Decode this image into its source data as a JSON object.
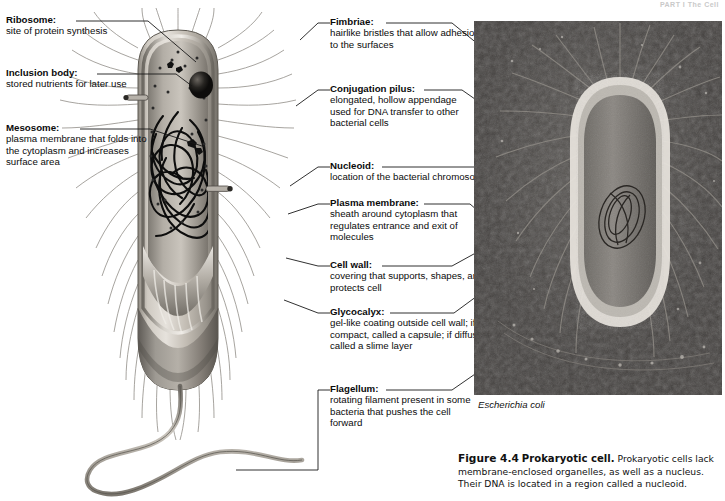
{
  "header": {
    "running_head": "PART I  The Cell"
  },
  "labels_left": [
    {
      "id": "ribosome",
      "term": "Ribosome:",
      "desc": "site of protein synthesis"
    },
    {
      "id": "inclusion-body",
      "term": "Inclusion body:",
      "desc": "stored nutrients for later use"
    },
    {
      "id": "mesosome",
      "term": "Mesosome:",
      "desc": "plasma membrane that folds into the cytoplasm and increases surface area"
    }
  ],
  "labels_right": [
    {
      "id": "fimbriae",
      "term": "Fimbriae:",
      "desc": "hairlike bristles that allow adhesion to the surfaces"
    },
    {
      "id": "conjugation-pilus",
      "term": "Conjugation pilus:",
      "desc": "elongated, hollow appendage used for DNA transfer to other bacterial cells"
    },
    {
      "id": "nucleoid",
      "term": "Nucleoid:",
      "desc": "location of the bacterial chromosome"
    },
    {
      "id": "plasma-membrane",
      "term": "Plasma membrane:",
      "desc": "sheath around cytoplasm that regulates entrance and exit of molecules"
    },
    {
      "id": "cell-wall",
      "term": "Cell wall:",
      "desc": "covering that supports, shapes, and protects cell"
    },
    {
      "id": "glycocalyx",
      "term": "Glycocalyx:",
      "desc": "gel-like coating outside cell wall; if compact, called a capsule; if diffuse, called a slime layer"
    },
    {
      "id": "flagellum",
      "term": "Flagellum:",
      "desc": "rotating filament present in some bacteria that pushes the cell forward"
    }
  ],
  "micrograph": {
    "organism_caption": "Escherichia coli"
  },
  "figure_caption": {
    "number": "Figure 4.4",
    "title": "Prokaryotic cell.",
    "body": "Prokaryotic cells lack membrane-enclosed organelles, as well as a nucleus. Their DNA is located in a region called a nucleoid."
  },
  "colors": {
    "leader_line": "#1a1a1a",
    "photo_background": "#4b4b4b",
    "cell_wall": "#b9b4ab",
    "cytoplasm": "#a7a29a",
    "nucleoid_dna": "#111111",
    "text": "#0b0b0b"
  }
}
